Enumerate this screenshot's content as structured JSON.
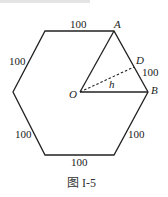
{
  "figure": {
    "caption": "图  I-5",
    "colors": {
      "stroke": "#222222",
      "text": "#1a1a1a"
    },
    "points": {
      "A": {
        "label": "A",
        "x": 114,
        "y": 31
      },
      "B": {
        "label": "B",
        "x": 148,
        "y": 92
      },
      "O": {
        "label": "O",
        "x": 80,
        "y": 92
      },
      "D": {
        "label": "D",
        "x": 134,
        "y": 67
      }
    },
    "hexagon_vertices": [
      [
        45,
        31
      ],
      [
        114,
        31
      ],
      [
        148,
        92
      ],
      [
        114,
        155
      ],
      [
        45,
        155
      ],
      [
        13,
        92
      ]
    ],
    "edge_labels": {
      "top": "100",
      "upper_left": "100",
      "upper_right": "100",
      "lower_left": "100",
      "lower_right": "100",
      "bottom": "100"
    },
    "height_label": "h"
  }
}
